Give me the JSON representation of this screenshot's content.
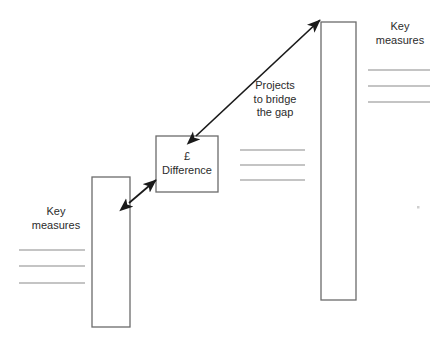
{
  "diagram": {
    "type": "gap-analysis-bridge-diagram",
    "background_color": "#ffffff",
    "stroke_color": "#6b6b6b",
    "arrow_color": "#1a1a1a",
    "text_color": "#2b2b2b",
    "rule_color": "#8a8a8a",
    "labels": {
      "key_measures_left": {
        "line1": "Key",
        "line2": "measures"
      },
      "key_measures_right": {
        "line1": "Key",
        "line2": "measures"
      },
      "difference_box": {
        "line1": "£",
        "line2": "Difference"
      },
      "projects_arrow": {
        "line1": "Projects",
        "line2": "to bridge",
        "line3": "the gap"
      }
    },
    "shapes": {
      "current_state_bar": {
        "name": "current-state-bar",
        "x": 92,
        "y": 177,
        "width": 38,
        "height": 150
      },
      "difference_box": {
        "name": "difference-box",
        "x": 156,
        "y": 136,
        "width": 62,
        "height": 56
      },
      "target_state_bar": {
        "name": "target-state-bar",
        "x": 321,
        "y": 22,
        "width": 35,
        "height": 278
      }
    },
    "arrows": {
      "short_arrow": {
        "name": "bar-to-difference-arrow",
        "x1": 129,
        "y1": 203,
        "x2": 156,
        "y2": 180,
        "heads": "both"
      },
      "long_arrow": {
        "name": "difference-to-target-arrow",
        "x1": 196,
        "y1": 136,
        "x2": 320,
        "y2": 20,
        "heads": "both"
      }
    },
    "rule_groups": {
      "left_measures_rules": {
        "name": "left-measure-rules",
        "x1": 19,
        "x2": 85,
        "ys": [
          250,
          266,
          283
        ]
      },
      "middle_project_rules": {
        "name": "middle-project-rules",
        "x1": 240,
        "x2": 305,
        "ys": [
          150,
          165,
          180
        ]
      },
      "right_measures_rules": {
        "name": "right-measure-rules",
        "x1": 368,
        "x2": 430,
        "ys": [
          70,
          86,
          102
        ]
      }
    },
    "artifact_dot": {
      "name": "scan-artifact-dot",
      "x": 418,
      "y": 207
    }
  }
}
